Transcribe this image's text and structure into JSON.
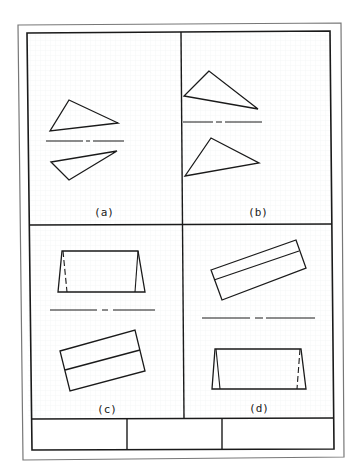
{
  "sheet": {
    "background": "#ffffff",
    "line_color": "#1a1a1a",
    "grid_color": "#eef0f2",
    "frame_outer_color": "#555555"
  },
  "panels": [
    {
      "id": "a",
      "label": "(a)",
      "content": "two triangles mirrored about a center line"
    },
    {
      "id": "b",
      "label": "(b)",
      "content": "two triangles mirrored about a center line"
    },
    {
      "id": "c",
      "label": "(c)",
      "content": "trapezoid view above center line, rotated rectangle below"
    },
    {
      "id": "d",
      "label": "(d)",
      "content": "rotated rectangle above center line, trapezoid view below"
    }
  ],
  "title_block": {
    "cells": [
      "",
      "",
      ""
    ]
  }
}
